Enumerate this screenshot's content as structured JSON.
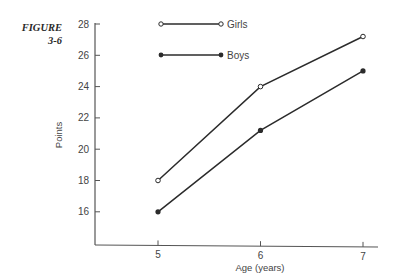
{
  "figure": {
    "label_line1": "FIGURE",
    "label_line2": "3-6"
  },
  "chart_data": {
    "type": "line",
    "title": "",
    "xlabel": "Age (years)",
    "ylabel": "Points",
    "x": [
      5,
      6,
      7
    ],
    "x_ticks": [
      "5",
      "6",
      "7"
    ],
    "y_ticks": [
      "16",
      "18",
      "20",
      "22",
      "24",
      "26",
      "28"
    ],
    "ylim": [
      14,
      28
    ],
    "grid": false,
    "legend_position": "top-left (inside plot)",
    "series": [
      {
        "name": "Girls",
        "marker": "open-circle",
        "values": [
          18,
          24,
          27.2
        ]
      },
      {
        "name": "Boys",
        "marker": "filled-circle",
        "values": [
          16,
          21.2,
          25
        ]
      }
    ]
  },
  "colors": {
    "line": "#2b2b2b",
    "axis": "#555555",
    "text": "#444444"
  }
}
